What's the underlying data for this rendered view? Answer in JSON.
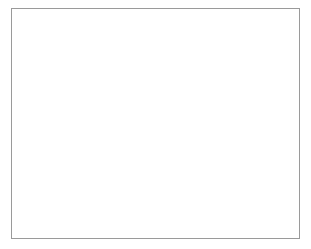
{
  "chart_data": {
    "type": "line",
    "title": "",
    "xlabel": "",
    "ylabel": "",
    "xlim": [
      1970,
      2015
    ],
    "ylim": [
      0,
      25
    ],
    "grid": true,
    "legend": "none",
    "marker": "open-circle",
    "line_color": "#8c8c8c",
    "marker_fill": "#ffffff",
    "marker_stroke": "#6f6f6f",
    "grid_color": "#c8c8c8",
    "axis_color": "#808080",
    "frame_color": "#9a9a9a",
    "xticks": [
      1970,
      1975,
      1980,
      1985,
      1990,
      1995,
      2000,
      2005,
      2010,
      2015
    ],
    "xtick_labels": [
      "1970",
      "1975",
      "1980",
      "1985",
      "1990",
      "1995",
      "2000",
      "2005",
      "2010",
      "2015"
    ],
    "yticks": [
      0,
      5,
      10,
      15,
      20,
      25
    ],
    "ytick_labels": [
      "0",
      "5",
      "10",
      "15",
      "20",
      "25"
    ],
    "x": [
      1970,
      1975,
      1979,
      1980,
      1990,
      2000,
      2008,
      2009,
      2010,
      2011,
      2012,
      2013,
      2014,
      2015
    ],
    "values": [
      14.9,
      20.3,
      22.8,
      22.6,
      20.8,
      18.1,
      20.3,
      19.1,
      19.3,
      19.4,
      19.6,
      18.5,
      17.4,
      16.9
    ],
    "point_labels": [
      {
        "x": 1970,
        "y": 14.9,
        "text": "14.9",
        "dx": 10,
        "dy": -4
      },
      {
        "x": 1975,
        "y": 20.3,
        "text": "20.3",
        "dx": 4,
        "dy": 16
      },
      {
        "x": 1979,
        "y": 22.8,
        "text": "22.8",
        "dx": -26,
        "dy": -7
      },
      {
        "x": 2015,
        "y": 16.9,
        "text": "16.9",
        "dx": -30,
        "dy": 14
      }
    ]
  }
}
